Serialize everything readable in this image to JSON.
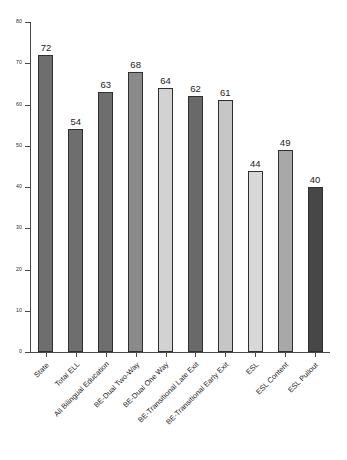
{
  "chart_data": {
    "type": "bar",
    "title": "",
    "subtitle": "",
    "xlabel": "",
    "ylabel": "",
    "ylim": [
      0,
      80
    ],
    "ytick_step": 10,
    "yticks": [
      "0",
      "10",
      "20",
      "30",
      "40",
      "50",
      "60",
      "70",
      "80"
    ],
    "grid": false,
    "legend": "none",
    "categories": [
      "State",
      "Total ELL",
      "All Bilingual Education",
      "BE-Dual Two-Way",
      "BE-Dual One Way",
      "BE-Transitional Late Exit",
      "BE-Transitional Early Exit",
      "ESL",
      "ESL Content",
      "ESL Pullout"
    ],
    "values": [
      72,
      54,
      63,
      68,
      64,
      62,
      61,
      44,
      49,
      40
    ],
    "value_labels": [
      "72",
      "54",
      "63",
      "68",
      "64",
      "62",
      "61",
      "44",
      "49",
      "40"
    ],
    "bar_colors": [
      "#6e6e6e",
      "#6e6e6e",
      "#6e6e6e",
      "#8a8a8a",
      "#d2d2d2",
      "#696969",
      "#c6c6c6",
      "#d8d8d8",
      "#a8a8a8",
      "#474747"
    ],
    "bar_edge_color": "#2f2f2f",
    "axis_color": "#4a4a4a"
  }
}
